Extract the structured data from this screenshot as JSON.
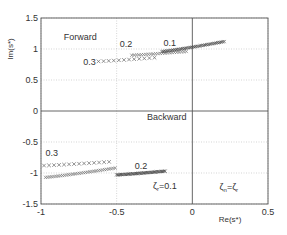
{
  "chart_data": {
    "type": "scatter",
    "title": "",
    "xlabel": "Re(s*)",
    "ylabel": "Im(s*)",
    "xlim": [
      -1,
      0.5
    ],
    "ylim": [
      -1.5,
      1.5
    ],
    "xticks": [
      "-1",
      "-0.5",
      "0",
      "0.5"
    ],
    "yticks": [
      "1.5",
      "1",
      "0.5",
      "0",
      "-0.5",
      "-1",
      "-1.5"
    ],
    "grid": true,
    "legend": "none",
    "annotations": [
      {
        "text": "Forward",
        "x": -0.85,
        "y": 1.15
      },
      {
        "text": "Backward",
        "x": -0.3,
        "y": -0.15
      },
      {
        "text": "0.3",
        "x": -0.72,
        "y": 0.75
      },
      {
        "text": "0.2",
        "x": -0.48,
        "y": 1.03
      },
      {
        "text": "0.1",
        "x": -0.19,
        "y": 1.05
      },
      {
        "text": "0.3",
        "x": -0.97,
        "y": -0.73
      },
      {
        "text": "0.2",
        "x": -0.38,
        "y": -0.93
      },
      {
        "text": "ζr=0.1",
        "x": -0.26,
        "y": -1.25
      },
      {
        "text": "ζn=ζr",
        "x": 0.18,
        "y": -1.28
      }
    ],
    "series": [
      {
        "name": "Forward ζ=0.3",
        "marker": "x",
        "density": "sparse",
        "x_start": -0.62,
        "x_end": -0.25,
        "y_start": 0.8,
        "y_end": 0.86,
        "count": 12
      },
      {
        "name": "Forward ζ=0.2",
        "marker": "x",
        "density": "dense",
        "x_start": -0.4,
        "x_end": -0.04,
        "y_start": 0.9,
        "y_end": 0.96,
        "count": 24
      },
      {
        "name": "Forward ζ=0.1",
        "marker": "x",
        "density": "very-dense",
        "x_start": -0.2,
        "x_end": 0.21,
        "y_start": 0.96,
        "y_end": 1.12,
        "count": 40
      },
      {
        "name": "Backward ζ=0.3",
        "marker": "x",
        "density": "sparse",
        "x_start": -0.98,
        "x_end": -0.55,
        "y_start": -0.88,
        "y_end": -0.82,
        "count": 14
      },
      {
        "name": "Backward ζ=0.2",
        "marker": "x",
        "density": "dense",
        "x_start": -0.97,
        "x_end": -0.51,
        "y_start": -1.07,
        "y_end": -0.92,
        "count": 34
      },
      {
        "name": "Backward ζ=0.1",
        "marker": "x",
        "density": "very-dense",
        "x_start": -0.5,
        "x_end": -0.18,
        "y_start": -1.03,
        "y_end": -0.97,
        "count": 40
      }
    ]
  },
  "colors": {
    "axis": "#555555",
    "grid": "#bbbbbb",
    "marker_sparse": "#666666",
    "marker_dense": "#777777",
    "marker_very_dense": "#444444",
    "text": "#333333"
  }
}
